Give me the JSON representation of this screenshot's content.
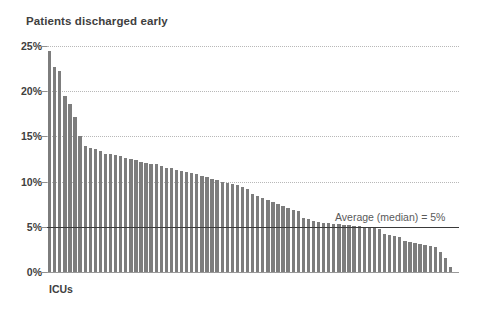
{
  "chart_data": {
    "type": "bar",
    "title": "Patients discharged early",
    "xlabel": "ICUs",
    "ylabel": "",
    "ylim": [
      0,
      25
    ],
    "grid": true,
    "legend": "none",
    "ytick_labels": [
      "25%",
      "20%",
      "15%",
      "10%",
      "5%",
      "0%"
    ],
    "ytick_values": [
      25,
      20,
      15,
      10,
      5,
      0
    ],
    "annotations": [
      {
        "name": "average-median-line",
        "text": "Average (median) = 5%",
        "value": 5,
        "color": "#3a3a3a"
      }
    ],
    "bar_color": "#7d7d7d",
    "categories": [
      "ICU 1",
      "ICU 2",
      "ICU 3",
      "ICU 4",
      "ICU 5",
      "ICU 6",
      "ICU 7",
      "ICU 8",
      "ICU 9",
      "ICU 10",
      "ICU 11",
      "ICU 12",
      "ICU 13",
      "ICU 14",
      "ICU 15",
      "ICU 16",
      "ICU 17",
      "ICU 18",
      "ICU 19",
      "ICU 20",
      "ICU 21",
      "ICU 22",
      "ICU 23",
      "ICU 24",
      "ICU 25",
      "ICU 26",
      "ICU 27",
      "ICU 28",
      "ICU 29",
      "ICU 30",
      "ICU 31",
      "ICU 32",
      "ICU 33",
      "ICU 34",
      "ICU 35",
      "ICU 36",
      "ICU 37",
      "ICU 38",
      "ICU 39",
      "ICU 40",
      "ICU 41",
      "ICU 42",
      "ICU 43",
      "ICU 44",
      "ICU 45",
      "ICU 46",
      "ICU 47",
      "ICU 48",
      "ICU 49",
      "ICU 50",
      "ICU 51",
      "ICU 52",
      "ICU 53",
      "ICU 54",
      "ICU 55",
      "ICU 56",
      "ICU 57",
      "ICU 58",
      "ICU 59",
      "ICU 60",
      "ICU 61",
      "ICU 62",
      "ICU 63",
      "ICU 64",
      "ICU 65",
      "ICU 66",
      "ICU 67",
      "ICU 68",
      "ICU 69",
      "ICU 70",
      "ICU 71",
      "ICU 72",
      "ICU 73",
      "ICU 74",
      "ICU 75",
      "ICU 76",
      "ICU 77",
      "ICU 78",
      "ICU 79",
      "ICU 80"
    ],
    "values": [
      24.5,
      22.7,
      22.2,
      19.5,
      18.6,
      17.2,
      15.0,
      13.9,
      13.7,
      13.6,
      13.4,
      13.1,
      13.0,
      12.9,
      12.8,
      12.6,
      12.5,
      12.4,
      12.2,
      12.1,
      12.0,
      11.9,
      11.7,
      11.5,
      11.5,
      11.3,
      11.2,
      11.1,
      10.9,
      10.8,
      10.6,
      10.5,
      10.3,
      10.2,
      10.0,
      9.9,
      9.7,
      9.6,
      9.4,
      9.2,
      8.6,
      8.4,
      8.2,
      8.0,
      7.7,
      7.5,
      7.3,
      7.1,
      6.9,
      6.7,
      6.0,
      5.9,
      5.6,
      5.5,
      5.4,
      5.4,
      5.3,
      5.3,
      5.2,
      5.2,
      5.1,
      5.1,
      5.0,
      5.0,
      4.9,
      4.8,
      4.2,
      4.1,
      4.0,
      3.9,
      3.4,
      3.3,
      3.2,
      3.1,
      3.0,
      2.9,
      2.8,
      2.2,
      1.5,
      0.6
    ]
  }
}
